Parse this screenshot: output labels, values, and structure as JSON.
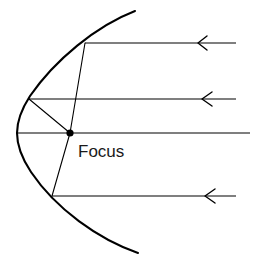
{
  "diagram": {
    "type": "optics-ray-diagram",
    "canvas": {
      "width": 254,
      "height": 263,
      "background": "#ffffff"
    },
    "stroke_color": "#000000",
    "label_color": "#1a1a1a",
    "labels": {
      "focus": "Focus"
    },
    "focus_point": {
      "x": 70,
      "y": 133,
      "radius": 3.6
    },
    "parabola": {
      "vertex": {
        "x": 17,
        "y": 133
      },
      "opens": "right",
      "path": "M 135 11 Q 17 60 17 133 Q 17 206 138 253",
      "top_end": {
        "x": 135,
        "y": 11
      },
      "bottom_end": {
        "x": 138,
        "y": 253
      },
      "stroke_width": 2.1
    },
    "incoming_rays": [
      {
        "name": "ray-top",
        "y": 43,
        "x_start": 236,
        "x_end": 85,
        "arrow_x": 199,
        "arrow_direction": "left",
        "hit_point": {
          "x": 85,
          "y": 43
        }
      },
      {
        "name": "ray-upper-middle",
        "y": 99,
        "x_start": 236,
        "x_end": 29,
        "arrow_x": 203,
        "arrow_direction": "left",
        "hit_point": {
          "x": 29,
          "y": 99
        }
      },
      {
        "name": "ray-axis",
        "y": 133,
        "x_start": 250,
        "x_end": 17,
        "arrow_x": null,
        "arrow_direction": "none",
        "hit_point": {
          "x": 17,
          "y": 133
        }
      },
      {
        "name": "ray-bottom",
        "y": 196,
        "x_start": 236,
        "x_end": 52,
        "arrow_x": 206,
        "arrow_direction": "left",
        "hit_point": {
          "x": 52,
          "y": 196
        }
      }
    ],
    "reflected_rays": [
      {
        "name": "reflected-from-top",
        "x1": 85,
        "y1": 43,
        "x2": 70,
        "y2": 133
      },
      {
        "name": "reflected-from-upper-middle",
        "x1": 29,
        "y1": 99,
        "x2": 70,
        "y2": 133
      },
      {
        "name": "reflected-from-bottom",
        "x1": 52,
        "y1": 196,
        "x2": 70,
        "y2": 133
      }
    ],
    "focus_label_position": {
      "x": 78,
      "y": 157
    }
  }
}
